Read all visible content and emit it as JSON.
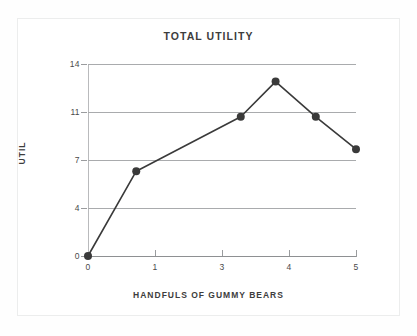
{
  "chart_data": {
    "type": "line",
    "title": "TOTAL UTILITY",
    "xlabel": "HANDFULS OF GUMMY BEARS",
    "ylabel": "UTIL",
    "x": [
      0,
      0.9,
      2.85,
      3.5,
      4.25,
      5
    ],
    "values": [
      0,
      6.3,
      10.6,
      12.9,
      10.6,
      7.9
    ],
    "points": [
      {
        "x": 0,
        "y": 0
      },
      {
        "x": 0.9,
        "y": 6.3
      },
      {
        "x": 2.85,
        "y": 10.6
      },
      {
        "x": 3.5,
        "y": 12.9
      },
      {
        "x": 4.25,
        "y": 10.6
      },
      {
        "x": 5,
        "y": 7.9
      }
    ],
    "xticks": [
      "0",
      "1",
      "3",
      "4",
      "5"
    ],
    "xtick_values": [
      0,
      1,
      3,
      4,
      5
    ],
    "yticks": [
      "0",
      "4",
      "7",
      "11",
      "14"
    ],
    "ytick_values": [
      0,
      4,
      7,
      11,
      14
    ],
    "xlim": [
      0,
      5
    ],
    "ylim": [
      0,
      14
    ],
    "grid": true,
    "legend": "none",
    "series_color": "#3a3a3a",
    "marker_color": "#3a3a3a",
    "grid_color": "#a9abad",
    "text_color": "#3d3d3d",
    "background": "#ffffff"
  }
}
